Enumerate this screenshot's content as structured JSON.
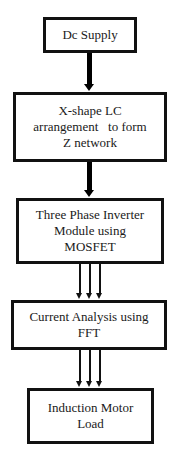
{
  "diagram": {
    "type": "block-flow",
    "direction": "top-to-bottom",
    "nodes": [
      {
        "id": "dc-supply",
        "lines": [
          "Dc Supply"
        ]
      },
      {
        "id": "x-shape-lc",
        "lines": [
          "X-shape LC",
          "arrangement   to form",
          "Z network"
        ]
      },
      {
        "id": "inverter",
        "lines": [
          "Three Phase Inverter",
          "Module using",
          "MOSFET"
        ]
      },
      {
        "id": "current-analysis",
        "lines": [
          "Current Analysis using",
          "FFT"
        ]
      },
      {
        "id": "motor-load",
        "lines": [
          "Induction Motor",
          "Load"
        ]
      }
    ],
    "edges": [
      {
        "from": "dc-supply",
        "to": "x-shape-lc",
        "style": "single-thick"
      },
      {
        "from": "x-shape-lc",
        "to": "inverter",
        "style": "single-thick"
      },
      {
        "from": "inverter",
        "to": "current-analysis",
        "style": "three-phase"
      },
      {
        "from": "current-analysis",
        "to": "motor-load",
        "style": "three-phase"
      }
    ],
    "colors": {
      "border": "#111111",
      "background": "#ffffff",
      "text": "#1a1a1a"
    }
  }
}
